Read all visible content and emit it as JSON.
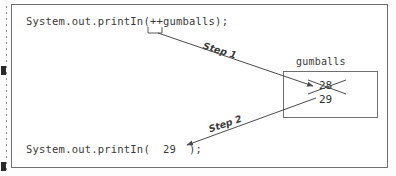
{
  "figure": {
    "type": "program-trace-diagram",
    "code_top": "System.out.printIn(++gumballs);",
    "code_bottom": "System.out.printIn(  29  );",
    "variable_label": "gumballs",
    "value_old": "28",
    "value_new": "29",
    "step1_label": "Step 1",
    "step2_label": "Step 2",
    "colors": {
      "ink": "#3a3a3a",
      "line": "#6f6f6f",
      "page": "#ffffff"
    }
  }
}
